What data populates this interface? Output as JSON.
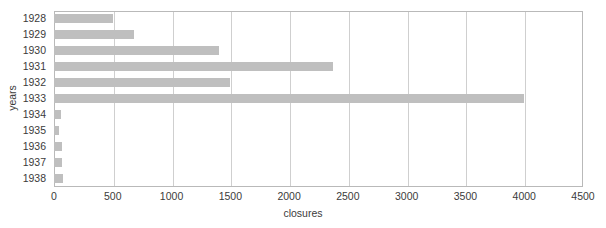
{
  "chart_data": {
    "type": "bar",
    "orientation": "horizontal",
    "title": "",
    "xlabel": "closures",
    "ylabel": "years",
    "categories": [
      "1928",
      "1929",
      "1930",
      "1931",
      "1932",
      "1933",
      "1934",
      "1935",
      "1936",
      "1937",
      "1938"
    ],
    "values": [
      500,
      680,
      1400,
      2370,
      1500,
      4000,
      60,
      40,
      70,
      70,
      80
    ],
    "xlim": [
      0,
      4500
    ],
    "xticks": [
      0,
      500,
      1000,
      1500,
      2000,
      2500,
      3000,
      3500,
      4000,
      4500
    ],
    "xtick_labels": [
      "0",
      "500",
      "1000",
      "1500",
      "2000",
      "2500",
      "3000",
      "3500",
      "4000",
      "4500"
    ],
    "grid": "vertical",
    "legend": null,
    "bar_color": "#bfbfbf",
    "frame_color": "#b9b9b9",
    "gridline_color": "#cfcfcf",
    "text_color": "#3b3b3b"
  }
}
